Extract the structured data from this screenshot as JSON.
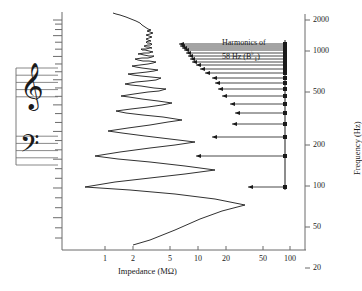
{
  "figure": {
    "type": "line",
    "background": "#ffffff",
    "line_color": "#1a1a1a",
    "frame": {
      "x_left_px": 62,
      "x_right_px": 300,
      "y_top_px": 12,
      "y_bottom_px": 250
    }
  },
  "axes": {
    "x": {
      "title_main": "Impedance",
      "title_unit": "(MΩ)",
      "title_full": "Impedance (MΩ)",
      "scale": "log",
      "ticks": [
        "1",
        "2",
        "5",
        "10",
        "20",
        "50",
        "100"
      ],
      "tick_values": [
        1,
        2,
        5,
        10,
        20,
        50,
        100
      ],
      "tick_px": [
        105,
        133,
        170,
        198,
        226,
        263,
        290
      ],
      "range": [
        0.8,
        130
      ]
    },
    "y_right": {
      "title_main": "Frequency",
      "title_unit": "(Hz)",
      "title_full": "Frequency (Hz)",
      "scale": "log",
      "ticks": [
        "2000",
        "1000",
        "500",
        "200",
        "100",
        "50",
        "20"
      ],
      "tick_values": [
        2000,
        1000,
        500,
        200,
        100,
        50,
        20
      ],
      "tick_px": [
        20,
        51,
        92,
        145,
        186,
        227,
        268
      ],
      "range": [
        17,
        2600
      ]
    },
    "y_left": {
      "description": "musical-pitch-scale",
      "tick_count": 27
    }
  },
  "annotation": {
    "line1": "Harmonics of",
    "line2_prefix": "58",
    "line2_unit": "Hz",
    "note_open": "(B",
    "note_flat": "♭",
    "note_index": "1",
    "note_close": ")",
    "full_text": "Harmonics of 58 Hz (B♭₁)",
    "x_px": 222,
    "y_px": 42
  },
  "staff": {
    "clef_treble": "𝄞",
    "clef_bass": "𝄢",
    "treble_glyph_label": "treble-clef",
    "bass_glyph_label": "bass-clef",
    "line_count_per_staff": 5,
    "x_px": 16,
    "width_px": 42,
    "y_px": 68,
    "height_px": 97
  },
  "chart_data": {
    "type": "line",
    "title": "",
    "xlabel": "Impedance (MΩ)",
    "ylabel": "Frequency (Hz)",
    "xlim": [
      0.8,
      130
    ],
    "ylim": [
      17,
      2600
    ],
    "xscale": "log",
    "yscale": "log",
    "grid": false,
    "legend": null,
    "series": [
      {
        "name": "input impedance",
        "comment": "zigzag resonance curve: alternating minima (low impedance, left) and maxima (high impedance, right); amplitude shrinks with rising frequency, then a noisy tail above ~1000 Hz",
        "points_px": [
          [
            133,
            245
          ],
          [
            150,
            240
          ],
          [
            175,
            230
          ],
          [
            200,
            219
          ],
          [
            222,
            211
          ],
          [
            245,
            205
          ],
          [
            215,
            199
          ],
          [
            175,
            194
          ],
          [
            130,
            190
          ],
          [
            85,
            187
          ],
          [
            115,
            182
          ],
          [
            150,
            178
          ],
          [
            185,
            174
          ],
          [
            215,
            170
          ],
          [
            185,
            166
          ],
          [
            150,
            162
          ],
          [
            118,
            159
          ],
          [
            95,
            156
          ],
          [
            120,
            152
          ],
          [
            150,
            148
          ],
          [
            175,
            145
          ],
          [
            195,
            142
          ],
          [
            170,
            139
          ],
          [
            145,
            136
          ],
          [
            122,
            133
          ],
          [
            108,
            131
          ],
          [
            128,
            128
          ],
          [
            150,
            125
          ],
          [
            168,
            122
          ],
          [
            182,
            120
          ],
          [
            163,
            117
          ],
          [
            143,
            115
          ],
          [
            126,
            113
          ],
          [
            116,
            111
          ],
          [
            131,
            109
          ],
          [
            148,
            107
          ],
          [
            162,
            105
          ],
          [
            172,
            103
          ],
          [
            158,
            101
          ],
          [
            142,
            99
          ],
          [
            129,
            97
          ],
          [
            121,
            96
          ],
          [
            134,
            94
          ],
          [
            148,
            92
          ],
          [
            159,
            91
          ],
          [
            166,
            89
          ],
          [
            154,
            88
          ],
          [
            141,
            86
          ],
          [
            131,
            85
          ],
          [
            125,
            84
          ],
          [
            136,
            82
          ],
          [
            147,
            81
          ],
          [
            156,
            80
          ],
          [
            161,
            78
          ],
          [
            151,
            77
          ],
          [
            141,
            76
          ],
          [
            133,
            75
          ],
          [
            128,
            74
          ],
          [
            138,
            73
          ],
          [
            147,
            72
          ],
          [
            154,
            71
          ],
          [
            158,
            70
          ],
          [
            150,
            69
          ],
          [
            142,
            68
          ],
          [
            136,
            67
          ],
          [
            132,
            66
          ],
          [
            140,
            65
          ],
          [
            148,
            64
          ],
          [
            153,
            63
          ],
          [
            156,
            62
          ],
          [
            149,
            61
          ],
          [
            143,
            61
          ],
          [
            138,
            60
          ],
          [
            135,
            59
          ],
          [
            142,
            58
          ],
          [
            148,
            58
          ],
          [
            152,
            57
          ],
          [
            154,
            56
          ],
          [
            149,
            56
          ],
          [
            144,
            55
          ],
          [
            140,
            54
          ],
          [
            138,
            54
          ],
          [
            144,
            53
          ],
          [
            149,
            53
          ],
          [
            152,
            52
          ],
          [
            153,
            52
          ],
          [
            149,
            51
          ],
          [
            145,
            50
          ],
          [
            142,
            50
          ],
          [
            141,
            49
          ],
          [
            146,
            49
          ],
          [
            150,
            48
          ],
          [
            152,
            48
          ],
          [
            149,
            47
          ],
          [
            146,
            47
          ],
          [
            144,
            46
          ],
          [
            148,
            45
          ],
          [
            151,
            45
          ],
          [
            152,
            44
          ],
          [
            149,
            43
          ],
          [
            147,
            43
          ],
          [
            146,
            42
          ],
          [
            149,
            41
          ],
          [
            151,
            41
          ],
          [
            148,
            40
          ],
          [
            146,
            39
          ],
          [
            149,
            38
          ],
          [
            152,
            37
          ],
          [
            149,
            36
          ],
          [
            146,
            35
          ],
          [
            150,
            34
          ],
          [
            153,
            33
          ],
          [
            150,
            32
          ],
          [
            147,
            31
          ],
          [
            151,
            30
          ],
          [
            148,
            29
          ],
          [
            145,
            27
          ],
          [
            142,
            25
          ],
          [
            140,
            23
          ],
          [
            136,
            21
          ],
          [
            131,
            19
          ],
          [
            126,
            17
          ],
          [
            120,
            15
          ],
          [
            116,
            14
          ],
          [
            113,
            13
          ]
        ]
      }
    ],
    "harmonic_markers": {
      "comment": "dots on the vertical line at x=285px with leftward arrows to the resonance peaks",
      "marker_x_px": 285,
      "entries": [
        {
          "harmonic": 1,
          "frequency_hz": 58,
          "y_px": 187,
          "arrow_tip_x_px": 248
        },
        {
          "harmonic": 2,
          "frequency_hz": 116,
          "y_px": 156,
          "arrow_tip_x_px": 196
        },
        {
          "harmonic": 3,
          "frequency_hz": 174,
          "y_px": 137,
          "arrow_tip_x_px": 212
        },
        {
          "harmonic": 4,
          "frequency_hz": 232,
          "y_px": 124,
          "arrow_tip_x_px": 232
        },
        {
          "harmonic": 5,
          "frequency_hz": 290,
          "y_px": 113,
          "arrow_tip_x_px": 235
        },
        {
          "harmonic": 6,
          "frequency_hz": 348,
          "y_px": 104,
          "arrow_tip_x_px": 230
        },
        {
          "harmonic": 7,
          "frequency_hz": 406,
          "y_px": 96,
          "arrow_tip_x_px": 222
        },
        {
          "harmonic": 8,
          "frequency_hz": 464,
          "y_px": 89,
          "arrow_tip_x_px": 218
        },
        {
          "harmonic": 9,
          "frequency_hz": 522,
          "y_px": 83,
          "arrow_tip_x_px": 215
        },
        {
          "harmonic": 10,
          "frequency_hz": 580,
          "y_px": 78,
          "arrow_tip_x_px": 212
        },
        {
          "harmonic": 11,
          "frequency_hz": 638,
          "y_px": 73,
          "arrow_tip_x_px": 205
        },
        {
          "harmonic": 12,
          "frequency_hz": 696,
          "y_px": 69,
          "arrow_tip_x_px": 200
        },
        {
          "harmonic": 13,
          "frequency_hz": 754,
          "y_px": 65,
          "arrow_tip_x_px": 196
        },
        {
          "harmonic": 14,
          "frequency_hz": 812,
          "y_px": 62,
          "arrow_tip_x_px": 192
        },
        {
          "harmonic": 15,
          "frequency_hz": 870,
          "y_px": 59,
          "arrow_tip_x_px": 190
        },
        {
          "harmonic": 16,
          "frequency_hz": 928,
          "y_px": 56,
          "arrow_tip_x_px": 188
        },
        {
          "harmonic": 17,
          "frequency_hz": 986,
          "y_px": 53,
          "arrow_tip_x_px": 186
        },
        {
          "harmonic": 18,
          "frequency_hz": 1044,
          "y_px": 50,
          "arrow_tip_x_px": 184
        },
        {
          "harmonic": 19,
          "frequency_hz": 1102,
          "y_px": 48,
          "arrow_tip_x_px": 182
        },
        {
          "harmonic": 20,
          "frequency_hz": 1160,
          "y_px": 46,
          "arrow_tip_x_px": 180
        },
        {
          "harmonic": 21,
          "frequency_hz": 1218,
          "y_px": 44,
          "arrow_tip_x_px": 179
        }
      ]
    }
  }
}
